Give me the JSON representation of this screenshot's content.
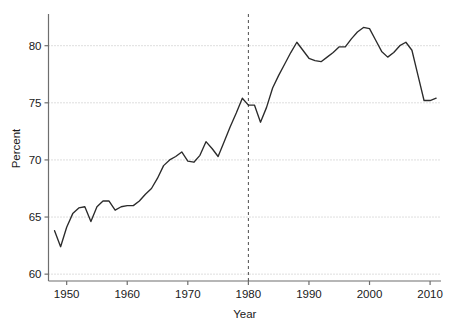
{
  "chart_data": {
    "type": "line",
    "title": "",
    "xlabel": "Year",
    "ylabel": "Percent",
    "xlim": [
      1947.0,
      2011.8
    ],
    "ylim": [
      59.4,
      82.6
    ],
    "xticks": [
      1950,
      1960,
      1970,
      1980,
      1990,
      2000,
      2010
    ],
    "xtick_labels": [
      "1950",
      "1960",
      "1970",
      "1980",
      "1990",
      "2000",
      "2010"
    ],
    "yticks": [
      60,
      65,
      70,
      75,
      80
    ],
    "ytick_labels": [
      "60",
      "65",
      "70",
      "75",
      "80"
    ],
    "grid": "horizontal-dotted",
    "legend": "none",
    "line_color": "#2b2b2b",
    "grid_color": "#bdbdbd",
    "axis_color": "#6e6e6e",
    "annotations": [
      {
        "type": "vline",
        "x": 1980,
        "style": "dashed",
        "color": "#4d4d4d",
        "label": ""
      }
    ],
    "x": [
      1948,
      1949,
      1950,
      1951,
      1952,
      1953,
      1954,
      1955,
      1956,
      1957,
      1958,
      1959,
      1960,
      1961,
      1962,
      1963,
      1964,
      1965,
      1966,
      1967,
      1968,
      1969,
      1970,
      1971,
      1972,
      1973,
      1974,
      1975,
      1976,
      1977,
      1978,
      1979,
      1980,
      1981,
      1982,
      1983,
      1984,
      1985,
      1986,
      1987,
      1988,
      1989,
      1990,
      1991,
      1992,
      1993,
      1994,
      1995,
      1996,
      1997,
      1998,
      1999,
      2000,
      2001,
      2002,
      2003,
      2004,
      2005,
      2006,
      2007,
      2008,
      2009,
      2010,
      2011
    ],
    "values": [
      63.8,
      62.4,
      64.1,
      65.3,
      65.8,
      65.9,
      64.6,
      65.9,
      66.4,
      66.4,
      65.6,
      65.9,
      66.0,
      66.0,
      66.4,
      67.0,
      67.5,
      68.4,
      69.5,
      70.0,
      70.3,
      70.7,
      69.9,
      69.8,
      70.4,
      71.6,
      71.0,
      70.3,
      71.6,
      72.9,
      74.1,
      75.4,
      74.8,
      74.8,
      73.3,
      74.6,
      76.3,
      77.4,
      78.4,
      79.4,
      80.3,
      79.6,
      78.9,
      78.7,
      78.6,
      79.0,
      79.4,
      79.9,
      79.9,
      80.6,
      81.2,
      81.6,
      81.5,
      80.5,
      79.5,
      79.0,
      79.4,
      80.0,
      80.3,
      79.6,
      77.4,
      75.2,
      75.2,
      75.4
    ]
  },
  "axes": {
    "x_axis_label": "Year",
    "y_axis_label": "Percent"
  }
}
